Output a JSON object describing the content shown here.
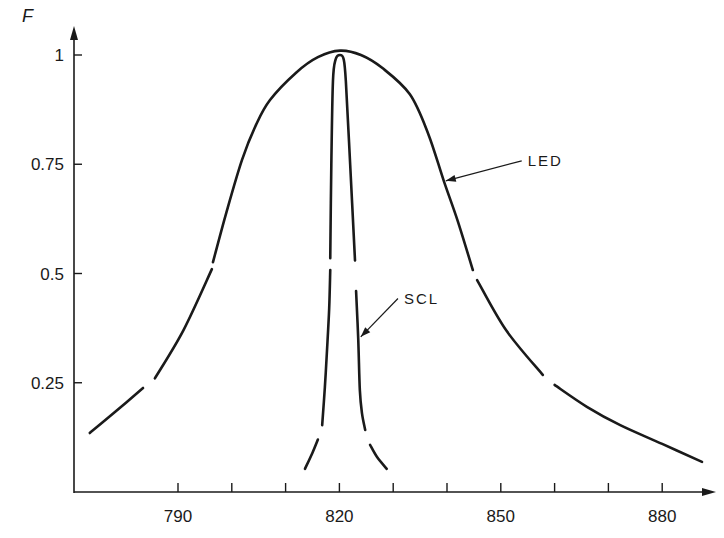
{
  "chart_data": {
    "type": "line",
    "title": "",
    "xlabel": "",
    "ylabel": "F",
    "xlim": [
      770,
      890
    ],
    "ylim": [
      0,
      1.08
    ],
    "grid": false,
    "x_ticks": [
      790,
      800,
      810,
      820,
      830,
      840,
      850,
      860,
      870,
      880
    ],
    "x_tick_labels": [
      "790",
      "",
      "",
      "820",
      "",
      "",
      "850",
      "",
      "",
      "880"
    ],
    "y_ticks": [
      0.25,
      0.5,
      0.75,
      1
    ],
    "y_tick_labels": [
      "0.25",
      "0.5",
      "0.75",
      "1"
    ],
    "line_color": "#1a1a1a",
    "series": [
      {
        "name": "LED",
        "label": "LED",
        "segments": [
          [
            [
              773.6,
              0.135
            ],
            [
              778,
              0.18
            ],
            [
              783.5,
              0.238
            ]
          ],
          [
            [
              785.7,
              0.26
            ],
            [
              791,
              0.37
            ],
            [
              796.3,
              0.51
            ]
          ],
          [
            [
              796.5,
              0.526
            ],
            [
              799,
              0.64
            ],
            [
              801.9,
              0.76
            ],
            [
              804.5,
              0.84
            ],
            [
              807.1,
              0.897
            ],
            [
              812,
              0.96
            ],
            [
              816,
              0.995
            ],
            [
              820.1,
              1.01
            ],
            [
              824,
              1.0
            ],
            [
              828,
              0.97
            ],
            [
              833.1,
              0.91
            ],
            [
              836.5,
              0.82
            ],
            [
              839.4,
              0.712
            ],
            [
              842,
              0.62
            ],
            [
              844.8,
              0.508
            ]
          ],
          [
            [
              845.6,
              0.485
            ],
            [
              851,
              0.37
            ],
            [
              857.8,
              0.268
            ]
          ],
          [
            [
              860,
              0.245
            ],
            [
              866,
              0.195
            ],
            [
              872.2,
              0.153
            ],
            [
              880,
              0.11
            ],
            [
              887.4,
              0.069
            ]
          ]
        ],
        "annotation": {
          "text": "LED",
          "x": 855,
          "y": 0.76,
          "arrow_to": [
            839.4,
            0.712
          ]
        }
      },
      {
        "name": "SCL",
        "label": "SCL",
        "segments": [
          [
            [
              813.6,
              0.053
            ],
            [
              815,
              0.09
            ],
            [
              816,
              0.12
            ]
          ],
          [
            [
              816.8,
              0.153
            ],
            [
              817.3,
              0.24
            ],
            [
              817.7,
              0.325
            ],
            [
              818.1,
              0.42
            ],
            [
              818.3,
              0.508
            ]
          ],
          [
            [
              818.3,
              0.535
            ],
            [
              818.5,
              0.75
            ],
            [
              818.8,
              0.94
            ],
            [
              819.3,
              0.99
            ],
            [
              820.1,
              1.0
            ],
            [
              820.8,
              0.99
            ],
            [
              821.2,
              0.94
            ],
            [
              822,
              0.75
            ],
            [
              822.9,
              0.53
            ]
          ],
          [
            [
              823.1,
              0.46
            ],
            [
              823.5,
              0.35
            ],
            [
              823.8,
              0.233
            ],
            [
              824.2,
              0.18
            ],
            [
              824.8,
              0.142
            ]
          ],
          [
            [
              825.7,
              0.108
            ],
            [
              827,
              0.08
            ],
            [
              828.8,
              0.053
            ]
          ]
        ],
        "annotation": {
          "text": "SCL",
          "x": 832,
          "y": 0.445,
          "arrow_to": [
            823.6,
            0.355
          ]
        }
      }
    ]
  }
}
